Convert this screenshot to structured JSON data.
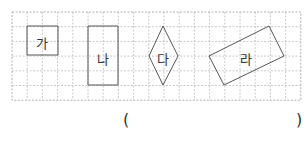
{
  "grid": {
    "x": 12,
    "y": 12,
    "cols": 19,
    "rows": 6,
    "cell_w": 15.2,
    "cell_h": 14.7,
    "line_color": "#bdbdbd",
    "border_color": "#b0b0b0"
  },
  "shapes": [
    {
      "label": "가",
      "type": "square",
      "points": [
        [
          27,
          26
        ],
        [
          58,
          26
        ],
        [
          58,
          55
        ],
        [
          27,
          55
        ]
      ],
      "label_pos": [
        42,
        43
      ]
    },
    {
      "label": "나",
      "type": "rectangle",
      "points": [
        [
          88,
          26
        ],
        [
          118,
          26
        ],
        [
          118,
          85
        ],
        [
          88,
          85
        ]
      ],
      "label_pos": [
        103,
        59
      ]
    },
    {
      "label": "다",
      "type": "rhombus",
      "points": [
        [
          163,
          26
        ],
        [
          178,
          56
        ],
        [
          163,
          85
        ],
        [
          149,
          56
        ]
      ],
      "label_pos": [
        163,
        59
      ]
    },
    {
      "label": "라",
      "type": "rotated-rectangle",
      "points": [
        [
          209,
          56
        ],
        [
          269,
          26
        ],
        [
          284,
          56
        ],
        [
          224,
          85
        ]
      ],
      "label_pos": [
        246,
        59
      ]
    }
  ],
  "answer": {
    "open": "(",
    "close": ")",
    "value": ""
  },
  "stroke_color": "#555555"
}
